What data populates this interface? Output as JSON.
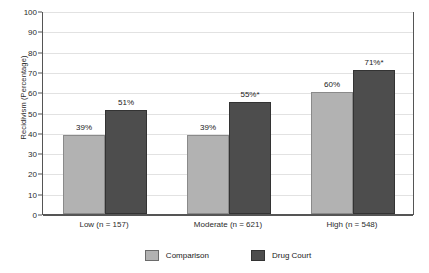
{
  "chart_data": {
    "type": "bar",
    "title": "",
    "xlabel": "",
    "ylabel": "Recidivism (Percentage)",
    "ylim": [
      0,
      100
    ],
    "ytick_step": 10,
    "yticks": [
      100,
      90,
      80,
      70,
      60,
      50,
      40,
      30,
      20,
      10,
      0
    ],
    "grid": true,
    "legend_position": "bottom",
    "categories": [
      "Low (n = 157)",
      "Moderate (n = 621)",
      "High (n = 548)"
    ],
    "series": [
      {
        "name": "Comparison",
        "color": "#b2b2b2",
        "values": [
          39,
          39,
          60
        ],
        "labels": [
          "39%",
          "39%",
          "60%"
        ]
      },
      {
        "name": "Drug Court",
        "color": "#4d4d4d",
        "values": [
          51,
          55,
          71
        ],
        "labels": [
          "51%",
          "55%*",
          "71%*"
        ]
      }
    ],
    "annotations": [
      "* denotes statistically significant difference"
    ]
  },
  "legend": {
    "items": [
      {
        "label": "Comparison",
        "color": "#b2b2b2"
      },
      {
        "label": "Drug Court",
        "color": "#4d4d4d"
      }
    ]
  }
}
